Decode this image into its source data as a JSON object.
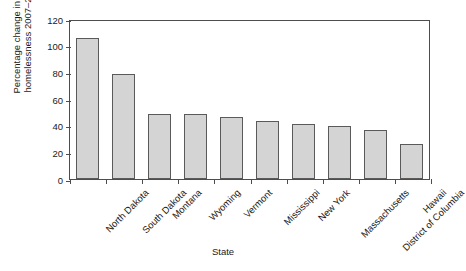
{
  "chart_data": {
    "type": "bar",
    "title": "",
    "xlabel": "State",
    "ylabel": "Percentage change in total\nhomelessness 2007–2015",
    "categories": [
      "North Dakota",
      "South Dakota",
      "Montana",
      "Wyoming",
      "Vermont",
      "Mississippi",
      "New York",
      "Massachusetts",
      "District of Columbia",
      "Hawaii"
    ],
    "values": [
      105.5,
      79,
      48.5,
      48.5,
      46.5,
      43.5,
      41,
      39.5,
      36.5,
      26
    ],
    "ylim": [
      0,
      120
    ],
    "yticks": [
      0,
      20,
      40,
      60,
      80,
      100,
      120
    ],
    "ytick_labels": [
      "0",
      "20",
      "40",
      "60",
      "80",
      "100",
      "120"
    ],
    "grid": false,
    "legend": "none",
    "bar_fill": "#d4d4d4",
    "bar_edge": "#5a5a5a",
    "axis_color": "#4d4d4d",
    "background": "#ffffff"
  }
}
